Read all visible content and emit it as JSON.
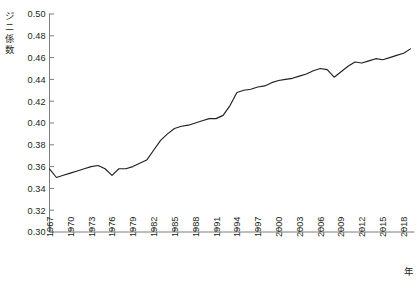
{
  "chart_data": {
    "type": "line",
    "title": "",
    "subtitle": "",
    "xlabel": "年",
    "ylabel": "ジニ係数",
    "ylim": [
      0.3,
      0.5
    ],
    "xlim": [
      1967,
      2019
    ],
    "ytick_step": 0.02,
    "xtick_step": 3,
    "grid": false,
    "legend": "none",
    "yticks": [
      "0.50",
      "0.48",
      "0.46",
      "0.44",
      "0.42",
      "0.40",
      "0.38",
      "0.36",
      "0.34",
      "0.32",
      "0.30"
    ],
    "ytick_values": [
      0.5,
      0.48,
      0.46,
      0.44,
      0.42,
      0.4,
      0.38,
      0.36,
      0.34,
      0.32,
      0.3
    ],
    "xticks": [
      "1967",
      "1970",
      "1973",
      "1976",
      "1979",
      "1982",
      "1985",
      "1988",
      "1991",
      "1994",
      "1997",
      "2000",
      "2003",
      "2006",
      "2009",
      "2012",
      "2015",
      "2018"
    ],
    "xtick_values": [
      1967,
      1970,
      1973,
      1976,
      1979,
      1982,
      1985,
      1988,
      1991,
      1994,
      1997,
      2000,
      2003,
      2006,
      2009,
      2012,
      2015,
      2018
    ],
    "series": [
      {
        "name": "ジニ係数",
        "color": "#221f1f",
        "x": [
          1967,
          1968,
          1969,
          1970,
          1971,
          1972,
          1973,
          1974,
          1975,
          1976,
          1977,
          1978,
          1979,
          1980,
          1981,
          1982,
          1983,
          1984,
          1985,
          1986,
          1987,
          1988,
          1989,
          1990,
          1991,
          1992,
          1993,
          1994,
          1995,
          1996,
          1997,
          1998,
          1999,
          2000,
          2001,
          2002,
          2003,
          2004,
          2005,
          2006,
          2007,
          2008,
          2009,
          2010,
          2011,
          2012,
          2013,
          2014,
          2015,
          2016,
          2017,
          2018,
          2019
        ],
        "values": [
          0.358,
          0.35,
          0.352,
          0.354,
          0.356,
          0.358,
          0.36,
          0.361,
          0.358,
          0.352,
          0.358,
          0.358,
          0.36,
          0.363,
          0.366,
          0.375,
          0.384,
          0.39,
          0.395,
          0.397,
          0.398,
          0.4,
          0.402,
          0.404,
          0.404,
          0.407,
          0.416,
          0.428,
          0.43,
          0.431,
          0.433,
          0.434,
          0.437,
          0.439,
          0.44,
          0.441,
          0.443,
          0.445,
          0.448,
          0.45,
          0.449,
          0.442,
          0.447,
          0.452,
          0.456,
          0.455,
          0.457,
          0.459,
          0.458,
          0.46,
          0.462,
          0.464,
          0.468
        ]
      }
    ]
  },
  "axis": {
    "y_label_chars": [
      "ジ",
      "ニ",
      "係",
      "数"
    ],
    "x_label": "年"
  }
}
